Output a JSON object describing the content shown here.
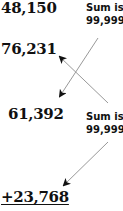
{
  "numbers": {
    "n1": "48,150",
    "n2": "76,231",
    "n3": "61,392",
    "n4": "+23,768"
  },
  "notes": {
    "top": {
      "line1": "Sum is",
      "line2": "99,999"
    },
    "bottom": {
      "line1": "Sum is",
      "line2": "99,999"
    }
  },
  "colors": {
    "text": "#111111",
    "arrow": "#999999",
    "arrowhead": "#111111"
  }
}
